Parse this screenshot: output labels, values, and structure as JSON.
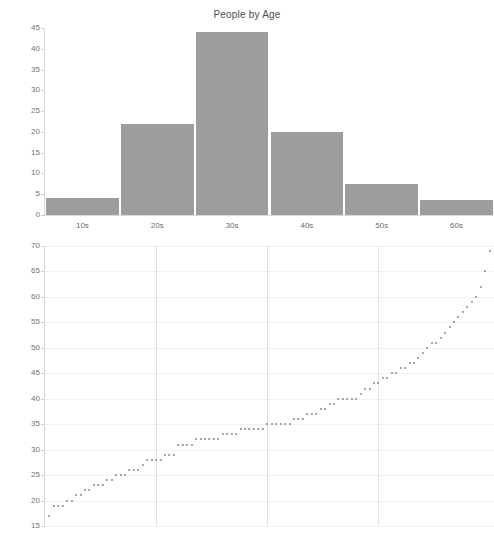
{
  "chart_data": [
    {
      "type": "bar",
      "id": "histogram",
      "title": "People by Age",
      "xlabel": "",
      "ylabel": "",
      "categories": [
        "10s",
        "20s",
        "30s",
        "40s",
        "50s",
        "60s"
      ],
      "values": [
        4,
        22,
        44,
        20,
        7.5,
        3.5
      ],
      "ylim": [
        0,
        45
      ],
      "yticks": [
        0,
        5,
        10,
        15,
        20,
        25,
        30,
        35,
        40,
        45
      ],
      "ytick_labels": [
        "0",
        "5",
        "10",
        "15",
        "20",
        "25",
        "30",
        "35",
        "40",
        "45"
      ],
      "xtick_labels": [
        "10s",
        "20s",
        "30s",
        "40s",
        "50s",
        "60s"
      ],
      "grid": false,
      "legend": "none",
      "bar_color": "#9d9d9d"
    },
    {
      "type": "scatter",
      "id": "sorted-ages",
      "title": "",
      "xlabel": "",
      "ylabel": "",
      "ylim": [
        15,
        70
      ],
      "yticks": [
        15,
        20,
        25,
        30,
        35,
        40,
        45,
        50,
        55,
        60,
        65,
        70
      ],
      "ytick_labels": [
        "15",
        "20",
        "25",
        "30",
        "35",
        "40",
        "45",
        "50",
        "55",
        "60",
        "65",
        "70"
      ],
      "xlim": [
        0,
        101
      ],
      "xticks": [],
      "xtick_labels": [],
      "grid": true,
      "gridlines_vertical": [
        25,
        50,
        75
      ],
      "legend": "none",
      "point_color": "#8a8a8a",
      "x": [
        1,
        2,
        3,
        4,
        5,
        6,
        7,
        8,
        9,
        10,
        11,
        12,
        13,
        14,
        15,
        16,
        17,
        18,
        19,
        20,
        21,
        22,
        23,
        24,
        25,
        26,
        27,
        28,
        29,
        30,
        31,
        32,
        33,
        34,
        35,
        36,
        37,
        38,
        39,
        40,
        41,
        42,
        43,
        44,
        45,
        46,
        47,
        48,
        49,
        50,
        51,
        52,
        53,
        54,
        55,
        56,
        57,
        58,
        59,
        60,
        61,
        62,
        63,
        64,
        65,
        66,
        67,
        68,
        69,
        70,
        71,
        72,
        73,
        74,
        75,
        76,
        77,
        78,
        79,
        80,
        81,
        82,
        83,
        84,
        85,
        86,
        87,
        88,
        89,
        90,
        91,
        92,
        93,
        94,
        95,
        96,
        97,
        98,
        99,
        100
      ],
      "y": [
        17,
        19,
        19,
        19,
        20,
        20,
        21,
        21,
        22,
        22,
        23,
        23,
        23,
        24,
        24,
        25,
        25,
        25,
        26,
        26,
        26,
        27,
        28,
        28,
        28,
        28,
        29,
        29,
        29,
        31,
        31,
        31,
        31,
        32,
        32,
        32,
        32,
        32,
        32,
        33,
        33,
        33,
        33,
        34,
        34,
        34,
        34,
        34,
        34,
        35,
        35,
        35,
        35,
        35,
        35,
        36,
        36,
        36,
        37,
        37,
        37,
        38,
        38,
        39,
        39,
        40,
        40,
        40,
        40,
        40,
        41,
        42,
        42,
        43,
        43,
        44,
        44,
        45,
        45,
        46,
        46,
        47,
        47,
        48,
        49,
        50,
        51,
        51,
        52,
        53,
        54,
        55,
        56,
        57,
        58,
        59,
        60,
        62,
        65,
        69
      ]
    }
  ]
}
